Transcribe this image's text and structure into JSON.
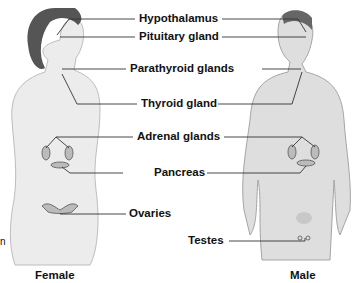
{
  "figure": {
    "labels": [
      {
        "id": "hypothalamus",
        "text": "Hypothalamus"
      },
      {
        "id": "pituitary",
        "text": "Pituitary gland"
      },
      {
        "id": "parathyroid",
        "text": "Parathyroid glands"
      },
      {
        "id": "thyroid",
        "text": "Thyroid gland"
      },
      {
        "id": "adrenal",
        "text": "Adrenal glands"
      },
      {
        "id": "pancreas",
        "text": "Pancreas"
      },
      {
        "id": "ovaries",
        "text": "Ovaries"
      },
      {
        "id": "testes",
        "text": "Testes"
      }
    ],
    "captions": {
      "female": "Female",
      "male": "Male"
    },
    "edge_fragment": "n"
  }
}
